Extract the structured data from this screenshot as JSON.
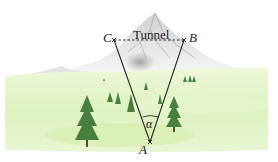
{
  "diagram": {
    "points": {
      "A": {
        "label": "A",
        "x": 150,
        "y": 142
      },
      "B": {
        "label": "B",
        "x": 184,
        "y": 40
      },
      "C": {
        "label": "C",
        "x": 114,
        "y": 40
      }
    },
    "tunnel_label": "Tunnel",
    "angle_label": "α",
    "colors": {
      "line": "#2a2a2a",
      "meadow_light": "#e6f5c9",
      "meadow_mid": "#d7efb1",
      "tree": "#3f7a3a",
      "mountain": "#a9a9a9"
    }
  }
}
